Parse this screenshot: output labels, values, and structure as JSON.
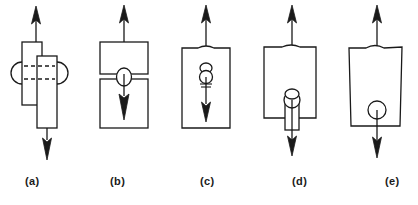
{
  "figure": {
    "type": "technical-line-diagram",
    "background_color": "#ffffff",
    "stroke_color": "#1a1a1a",
    "fill_color": "#ffffff",
    "panel_count": 5,
    "width": 418,
    "height": 205
  },
  "panels": [
    {
      "id": "a",
      "caption": "(a)",
      "caption_x": 25,
      "description": "Two offset overlapping vertical bars forming a lap joint, dashed hidden lines through the overlap with arcs on both sides",
      "arrows": [
        {
          "name": "top-arrow",
          "direction": "up"
        },
        {
          "name": "bottom-arrow",
          "direction": "down"
        }
      ],
      "features": [
        "left-bar",
        "right-bar",
        "dashed-line-upper",
        "dashed-line-lower",
        "left-arc",
        "right-arc"
      ]
    },
    {
      "id": "b",
      "caption": "(b)",
      "caption_x": 110,
      "description": "Two stacked rectangles separated by a thin gap with a small ellipse at the junction and a down arrow inside the lower block",
      "arrows": [
        {
          "name": "top-arrow",
          "direction": "up"
        },
        {
          "name": "inner-arrow",
          "direction": "down"
        }
      ],
      "features": [
        "upper-block",
        "lower-block",
        "junction-ellipse"
      ]
    },
    {
      "id": "c",
      "caption": "(c)",
      "caption_x": 200,
      "description": "Single rectangle with a notched top edge containing an internal circle with small oval above, hatch marks and a down arrow",
      "arrows": [
        {
          "name": "top-arrow",
          "direction": "up"
        },
        {
          "name": "inner-arrow",
          "direction": "down"
        }
      ],
      "features": [
        "block",
        "notched-top",
        "inner-circle",
        "inner-oval",
        "hatch-marks"
      ]
    },
    {
      "id": "d",
      "caption": "(d)",
      "caption_x": 292,
      "description": "Rectangle with a circle near the bottom sitting atop a narrow tab protruding below the block, arrow exits downward",
      "arrows": [
        {
          "name": "top-arrow",
          "direction": "up"
        },
        {
          "name": "bottom-arrow",
          "direction": "down"
        }
      ],
      "features": [
        "block",
        "notched-top",
        "circle",
        "narrow-tab"
      ]
    },
    {
      "id": "e",
      "caption": "(e)",
      "caption_x": 385,
      "description": "Slightly tapered rectangle with a notched top and a circle near the bottom edge, arrow exits downward",
      "arrows": [
        {
          "name": "top-arrow",
          "direction": "up"
        },
        {
          "name": "bottom-arrow",
          "direction": "down"
        }
      ],
      "features": [
        "tapered-block",
        "notched-top",
        "circle"
      ]
    }
  ],
  "caption_row": {
    "y": 175
  }
}
